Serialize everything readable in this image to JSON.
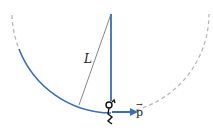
{
  "diagram": {
    "type": "pendulum-swing",
    "labels": {
      "length": "L",
      "momentum": "p"
    },
    "elements": [
      {
        "name": "pivot",
        "description": "fixed pivot point at top"
      },
      {
        "name": "rope",
        "description": "vertical rope of length L from pivot to person"
      },
      {
        "name": "radius-line",
        "description": "thin line indicating L from pivot to arc"
      },
      {
        "name": "solid-arc",
        "description": "path swung so far (left side to bottom)"
      },
      {
        "name": "dashed-arc",
        "description": "remaining circular path continuing up both sides"
      },
      {
        "name": "person",
        "description": "stick figure hanging at bottom of rope"
      },
      {
        "name": "momentum-arrow",
        "description": "horizontal vector p pointing right"
      }
    ],
    "colors": {
      "rope": "#3a6fb0",
      "arc": "#3a6fb0",
      "dashed": "#b8b8b8",
      "radius_line": "#555555",
      "figure": "#111111"
    }
  }
}
